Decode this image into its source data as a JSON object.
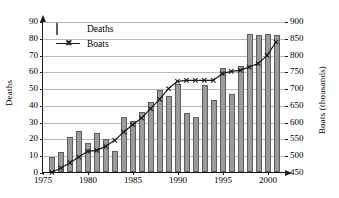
{
  "chart_data": {
    "type": "bar",
    "title": "",
    "xlabel": "",
    "ylabel": "Deaths",
    "y2label": "Boats (thousands)",
    "grid": true,
    "legend_position": "top-left",
    "xlim": [
      1975,
      2002
    ],
    "ylim": [
      0,
      90
    ],
    "y2lim": [
      450,
      900
    ],
    "xticks": [
      "1975",
      "1980",
      "1985",
      "1990",
      "1995",
      "2000"
    ],
    "xtick_values": [
      1975,
      1980,
      1985,
      1990,
      1995,
      2000
    ],
    "yticks": [
      "0",
      "10",
      "20",
      "30",
      "40",
      "50",
      "60",
      "70",
      "80",
      "90"
    ],
    "ytick_values": [
      0,
      10,
      20,
      30,
      40,
      50,
      60,
      70,
      80,
      90
    ],
    "y2ticks": [
      "450",
      "500",
      "550",
      "600",
      "650",
      "700",
      "750",
      "800",
      "850",
      "900"
    ],
    "y2tick_values": [
      450,
      500,
      550,
      600,
      650,
      700,
      750,
      800,
      850,
      900
    ],
    "x": [
      1976,
      1977,
      1978,
      1979,
      1980,
      1981,
      1982,
      1983,
      1984,
      1985,
      1986,
      1987,
      1988,
      1989,
      1990,
      1991,
      1992,
      1993,
      1994,
      1995,
      1996,
      1997,
      1998,
      1999,
      2000,
      2001
    ],
    "series": [
      {
        "name": "Deaths",
        "type": "bar",
        "axis": "left",
        "unit": "deaths",
        "color": "#9b9b9b",
        "edge_color": "#5d5d5d",
        "values": [
          9,
          12,
          21,
          24.5,
          17,
          23,
          19.5,
          12.5,
          32.5,
          30.5,
          36,
          42,
          49,
          45.5,
          52.5,
          35,
          32.5,
          52,
          43,
          62,
          46.5,
          63,
          82,
          81.5,
          82,
          81.5
        ]
      },
      {
        "name": "Boats",
        "type": "line",
        "axis": "right",
        "unit": "thousands",
        "color": "#1a1a1a",
        "marker": "x",
        "values": [
          449,
          462,
          478,
          495,
          512,
          515,
          527,
          545,
          570,
          592,
          612,
          640,
          668,
          700,
          722,
          725,
          725,
          725,
          725,
          745,
          752,
          755,
          765,
          775,
          800,
          840
        ]
      }
    ]
  },
  "legend": {
    "items": [
      {
        "label": "Deaths",
        "key": "bar-swatch"
      },
      {
        "label": "Boats",
        "key": "line-marker"
      }
    ]
  },
  "axes": {
    "left_title": "Deaths",
    "right_title": "Boats (thousands)"
  }
}
